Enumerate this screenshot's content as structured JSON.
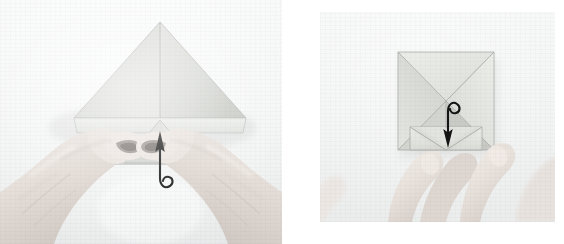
{
  "page": {
    "background_color": "#ffffff",
    "width": 564,
    "height": 244,
    "panel_count": 2
  },
  "panels": [
    {
      "id": "panel-left",
      "name": "step-photo-left",
      "step_number": "1",
      "x": 0,
      "y": 0,
      "width": 282,
      "height": 244,
      "background_color": "#f3f4f4",
      "description": "Two hands holding a folded square of pale grey paper shaped into a large upward triangle with a small center flap being lifted",
      "paper_color": "#d9dad6",
      "paper_shadow_color": "#bcbdb9",
      "hand_color": "#e3dcd7",
      "arrow": {
        "name": "fold-up-arrow",
        "direction": "up",
        "style": "curved-hook-tail",
        "color": "#141414",
        "label": "fold up"
      }
    },
    {
      "id": "panel-right",
      "name": "step-photo-right",
      "step_number": "2",
      "x": 320,
      "y": 12,
      "width": 235,
      "height": 210,
      "background_color": "#f1f2f2",
      "description": "A square sheet with X-shaped diagonal creases forming four spikes, fingers at the bottom edge pressing a flap downward",
      "paper_color": "#dcdedb",
      "paper_shadow_color": "#b9bbb8",
      "hand_color": "#e6e0db",
      "arrow": {
        "name": "fold-down-arrow",
        "direction": "down",
        "style": "curved-hook-tail",
        "color": "#141414",
        "label": "fold down"
      }
    }
  ],
  "colors": {
    "page_background": "#ffffff",
    "paper_light": "#e9eae6",
    "paper_mid": "#d4d6d2",
    "paper_dark": "#b4b6b2",
    "crease_line": "#a8aaa6",
    "arrow": "#141414",
    "skin_light": "#efe9e4",
    "skin_mid": "#ddd5cf",
    "skin_shadow": "#c6bdb7"
  }
}
